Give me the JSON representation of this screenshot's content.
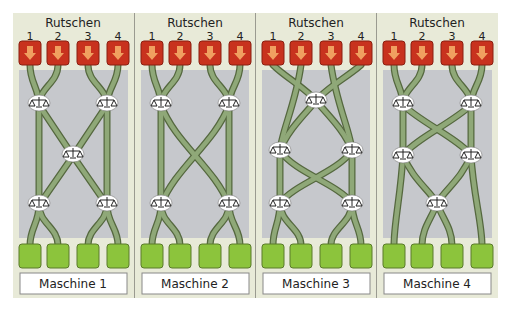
{
  "colors": {
    "panel_bg": "#e8ead8",
    "inner_bg": "#c6c8cc",
    "slide_fill": "#c8321e",
    "slide_stroke": "#8a1f10",
    "arrow": "#f0a060",
    "machine_fill": "#8cc43c",
    "machine_stroke": "#5a7a2a",
    "track": "#8fa878",
    "track_edge": "#55683f",
    "divider": "#9a9a90"
  },
  "panels": [
    {
      "title": "Rutschen",
      "slides": [
        "1",
        "2",
        "3",
        "4"
      ],
      "label": "Maschine 1",
      "balances": [
        [
          0.22,
          0.18
        ],
        [
          0.78,
          0.18
        ],
        [
          0.5,
          0.52
        ],
        [
          0.22,
          0.84
        ],
        [
          0.78,
          0.84
        ]
      ]
    },
    {
      "title": "Rutschen",
      "slides": [
        "1",
        "2",
        "3",
        "4"
      ],
      "label": "Maschine 2",
      "balances": [
        [
          0.22,
          0.18
        ],
        [
          0.78,
          0.18
        ],
        [
          0.22,
          0.84
        ],
        [
          0.78,
          0.84
        ]
      ]
    },
    {
      "title": "Rutschen",
      "slides": [
        "1",
        "2",
        "3",
        "4"
      ],
      "label": "Maschine 3",
      "balances": [
        [
          0.5,
          0.2
        ],
        [
          0.2,
          0.5
        ],
        [
          0.8,
          0.5
        ],
        [
          0.2,
          0.84
        ],
        [
          0.8,
          0.84
        ]
      ]
    },
    {
      "title": "Rutschen",
      "slides": [
        "1",
        "2",
        "3",
        "4"
      ],
      "label": "Maschine 4",
      "balances": [
        [
          0.22,
          0.18
        ],
        [
          0.78,
          0.18
        ],
        [
          0.22,
          0.52
        ],
        [
          0.78,
          0.52
        ],
        [
          0.5,
          0.84
        ]
      ]
    }
  ]
}
